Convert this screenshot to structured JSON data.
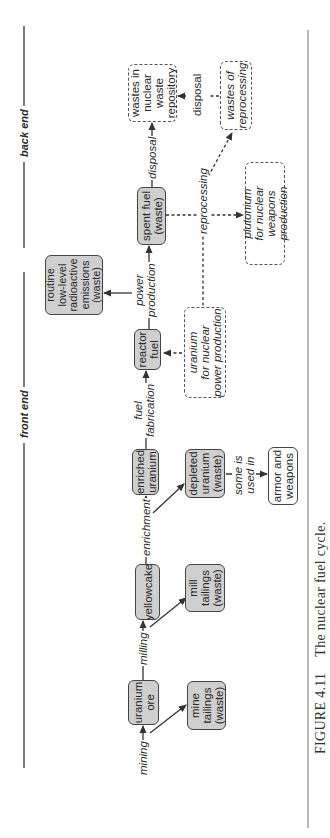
{
  "figure": {
    "number": "FIGURE 4.11",
    "title": "The nuclear fuel cycle."
  },
  "sections": {
    "front_end": "front end",
    "back_end": "back end"
  },
  "nodes": {
    "uranium_ore": "uranium\nore",
    "yellowcake": "yellowcake",
    "mine_tailings": "mine\ntailings\n(waste)",
    "mill_tailings": "mill\ntailings\n(waste)",
    "enriched_uranium": "enriched\nuranium",
    "depleted_uranium": "depleted\nuranium\n(waste)",
    "armor_weapons": "armor and\nweapons",
    "reactor_fuel": "reactor\nfuel",
    "uranium_power": "uranium\nfor nuclear\npower production",
    "routine_emissions": "routine\nlow-level\nradioactive\nemissions\n(waste)",
    "spent_fuel": "spent fuel\n(waste)",
    "waste_repository": "wastes in\nnuclear\nwaste\nrepository",
    "wastes_reprocessing": "wastes of\nreprocessing",
    "plutonium": "plutonium\nfor nuclear\nweapons production"
  },
  "processes": {
    "mining": "mining",
    "milling": "milling",
    "enrichment": "enrichment",
    "fuel_fabrication": "fuel\nfabrication",
    "power_production": "power\nproduction",
    "disposal_main": "disposal",
    "disposal_reprocessing": "disposal",
    "reprocessing": "reprocessing",
    "some_used_in": "some is\nused in"
  },
  "colors": {
    "solid_box_fill": "#cfcfcf",
    "line": "#333333",
    "background": "#ffffff"
  }
}
